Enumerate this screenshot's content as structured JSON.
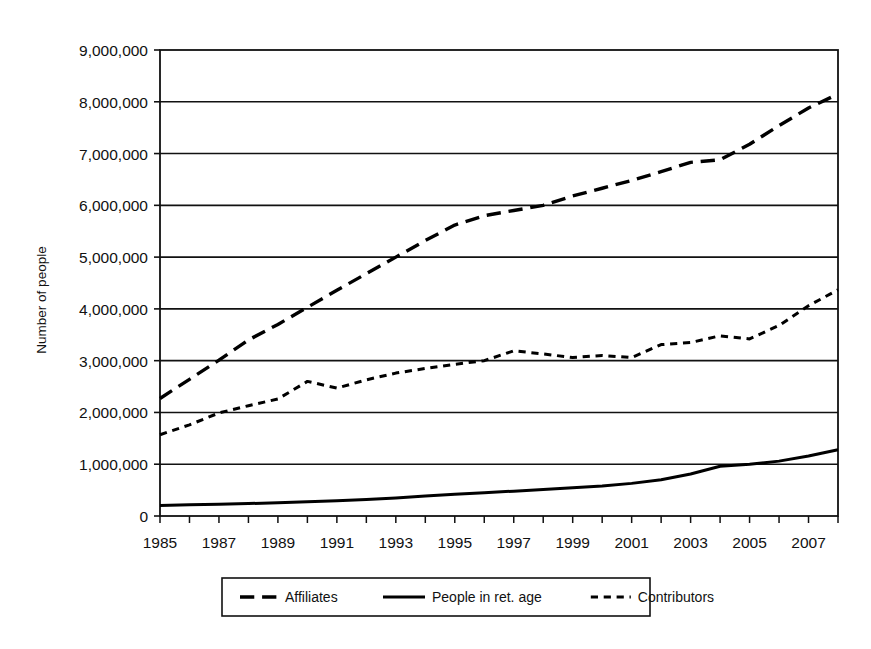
{
  "chart_data": {
    "type": "line",
    "title": "",
    "xlabel": "",
    "ylabel": "Number of people",
    "xlim": [
      1985,
      2008
    ],
    "ylim": [
      0,
      9000000
    ],
    "grid": "horizontal",
    "legend_position": "bottom",
    "ytick_labels": [
      "9,000,000",
      "8,000,000",
      "7,000,000",
      "6,000,000",
      "5,000,000",
      "4,000,000",
      "3,000,000",
      "2,000,000",
      "1,000,000",
      "0"
    ],
    "ytick_values": [
      9000000,
      8000000,
      7000000,
      6000000,
      5000000,
      4000000,
      3000000,
      2000000,
      1000000,
      0
    ],
    "xtick_labels": [
      "1985",
      "1987",
      "1989",
      "1991",
      "1993",
      "1995",
      "1997",
      "1999",
      "2001",
      "2003",
      "2005",
      "2007"
    ],
    "xtick_values": [
      1985,
      1987,
      1989,
      1991,
      1993,
      1995,
      1997,
      1999,
      2001,
      2003,
      2005,
      2007
    ],
    "x": [
      1985,
      1986,
      1987,
      1988,
      1989,
      1990,
      1991,
      1992,
      1993,
      1994,
      1995,
      1996,
      1997,
      1998,
      1999,
      2000,
      2001,
      2002,
      2003,
      2004,
      2005,
      2006,
      2007,
      2008
    ],
    "series": [
      {
        "name": "Affiliates",
        "dash": "long",
        "width": 3.4,
        "color": "#000000",
        "values": [
          2270000,
          2640000,
          3010000,
          3400000,
          3700000,
          4030000,
          4360000,
          4680000,
          5000000,
          5320000,
          5620000,
          5800000,
          5900000,
          6000000,
          6180000,
          6330000,
          6480000,
          6650000,
          6830000,
          6880000,
          7180000,
          7540000,
          7880000,
          8150000
        ]
      },
      {
        "name": "People in ret. age",
        "dash": "solid",
        "width": 3.0,
        "color": "#000000",
        "values": [
          205000,
          215000,
          225000,
          240000,
          255000,
          275000,
          295000,
          320000,
          350000,
          385000,
          420000,
          450000,
          480000,
          510000,
          545000,
          580000,
          630000,
          700000,
          810000,
          960000,
          1000000,
          1060000,
          1160000,
          1280000
        ]
      },
      {
        "name": "Contributors",
        "dash": "short",
        "width": 3.0,
        "color": "#000000",
        "values": [
          1570000,
          1760000,
          1990000,
          2130000,
          2260000,
          2600000,
          2470000,
          2630000,
          2760000,
          2850000,
          2930000,
          3000000,
          3190000,
          3130000,
          3060000,
          3100000,
          3060000,
          3310000,
          3350000,
          3480000,
          3420000,
          3680000,
          4060000,
          4370000
        ]
      }
    ],
    "legend": [
      {
        "label": "Affiliates",
        "dash": "long"
      },
      {
        "label": "People in ret. age",
        "dash": "solid"
      },
      {
        "label": "Contributors",
        "dash": "short"
      }
    ]
  }
}
